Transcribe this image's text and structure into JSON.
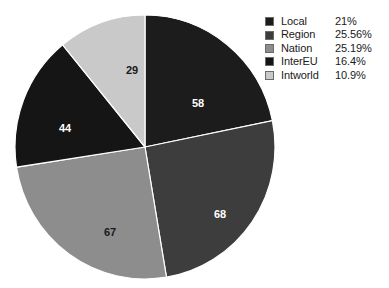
{
  "chart_data": {
    "type": "pie",
    "title": "",
    "legend_position": "top-right",
    "categories": [
      "Local",
      "Region",
      "Nation",
      "InterEU",
      "Intworld"
    ],
    "values": [
      58,
      68,
      67,
      44,
      29
    ],
    "total": 266,
    "value_labels": [
      "58",
      "68",
      "67",
      "44",
      "29"
    ],
    "percent_labels": [
      "21%",
      "25.56%",
      "25.19%",
      "16.4%",
      "10.9%"
    ],
    "colors": [
      "#1c1c1c",
      "#3d3d3d",
      "#8d8d8d",
      "#151515",
      "#c9c9c9"
    ],
    "start_angle_deg": 0,
    "direction": "clockwise",
    "slices": [
      {
        "name": "Local",
        "value": 58,
        "value_label": "58",
        "percent_label": "21%",
        "color": "#1c1c1c",
        "label_color": "#ffffff",
        "start_deg": 0,
        "end_deg": 78.5,
        "label_x": 184,
        "label_y": 93
      },
      {
        "name": "Region",
        "value": 68,
        "value_label": "68",
        "percent_label": "25.56%",
        "color": "#3d3d3d",
        "label_color": "#ffffff",
        "start_deg": 78.5,
        "end_deg": 170.5,
        "label_x": 206,
        "label_y": 204
      },
      {
        "name": "Nation",
        "value": 67,
        "value_label": "67",
        "percent_label": "25.19%",
        "color": "#8d8d8d",
        "label_color": "#1a1a1a",
        "start_deg": 170.5,
        "end_deg": 261.2,
        "label_x": 96,
        "label_y": 222
      },
      {
        "name": "InterEU",
        "value": 44,
        "value_label": "44",
        "percent_label": "16.4%",
        "color": "#151515",
        "label_color": "#ffffff",
        "start_deg": 261.2,
        "end_deg": 320.7,
        "label_x": 51,
        "label_y": 118
      },
      {
        "name": "Intworld",
        "value": 29,
        "value_label": "29",
        "percent_label": "10.9%",
        "color": "#c9c9c9",
        "label_color": "#1a1a1a",
        "start_deg": 320.7,
        "end_deg": 360,
        "label_x": 118,
        "label_y": 60
      }
    ]
  },
  "legend": {
    "rows": [
      {
        "name": "Local",
        "percent": "21%",
        "color": "#1c1c1c"
      },
      {
        "name": "Region",
        "percent": "25.56%",
        "color": "#3d3d3d"
      },
      {
        "name": "Nation",
        "percent": "25.19%",
        "color": "#8d8d8d"
      },
      {
        "name": "InterEU",
        "percent": "16.4%",
        "color": "#151515"
      },
      {
        "name": "Intworld",
        "percent": "10.9%",
        "color": "#c9c9c9"
      }
    ]
  }
}
